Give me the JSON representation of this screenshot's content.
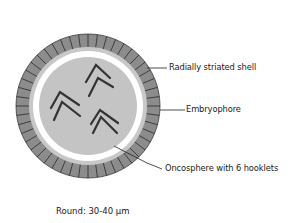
{
  "diagram": {
    "labels": [
      {
        "id": "shell",
        "text": "Radially striated shell"
      },
      {
        "id": "embryophore",
        "text": "Embryophore"
      },
      {
        "id": "oncosphere",
        "text": "Oncosphere with 6 hooklets"
      }
    ],
    "caption": "Round: 30-40 µm",
    "colors": {
      "shell": "#8c8c8c",
      "striation": "#2a2a2a",
      "embryophore_ring": "#c8c8c8",
      "gap": "#ffffff",
      "oncosphere": "#c4c4c4",
      "hooklet": "#333333",
      "leader_line": "#222222"
    },
    "hooklet_count": 6
  }
}
